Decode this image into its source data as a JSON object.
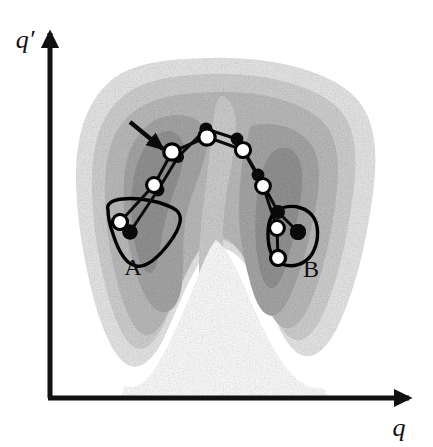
{
  "figure": {
    "kind": "free-energy-landscape-diagram",
    "width": 433,
    "height": 447,
    "background_color": "#ffffff"
  },
  "axes": {
    "x_label": "q",
    "y_label": "q′",
    "color": "#111111",
    "origin_x": 50,
    "origin_y": 398,
    "x_end": 412,
    "y_end": 30,
    "line_width": 5,
    "arrow_head": "solid-triangle"
  },
  "contours": {
    "description": "nested grayscale free-energy bands with a saddle ridge separating two basins",
    "levels": [
      {
        "name": "band-outer",
        "color": "#e9e9e9"
      },
      {
        "name": "band-2",
        "color": "#d2d2d2"
      },
      {
        "name": "band-3",
        "color": "#bdbdbd"
      },
      {
        "name": "band-4",
        "color": "#a8a8a8"
      },
      {
        "name": "band-core-a",
        "color": "#949494"
      },
      {
        "name": "band-core-b",
        "color": "#949494"
      }
    ],
    "ridge_color": "#cfcfcf",
    "notch_color": "#ffffff"
  },
  "basins": [
    {
      "id": "A",
      "label": "A",
      "label_x": 133,
      "label_y": 275,
      "shape": "triangular-outline",
      "outline_color": "#000000"
    },
    {
      "id": "B",
      "label": "B",
      "label_x": 311,
      "label_y": 277,
      "shape": "rounded-square-outline",
      "outline_color": "#000000"
    }
  ],
  "annotations": {
    "arrow": {
      "name": "pointer-arrow",
      "from_x": 130,
      "from_y": 122,
      "to_x": 166,
      "to_y": 152,
      "color": "#0a0a0a"
    }
  },
  "chains": {
    "open_node_color": "#ffffff",
    "open_node_stroke": "#000000",
    "filled_node_color": "#0a0a0a",
    "link_color": "#0a0a0a",
    "chain_white": {
      "name": "string-of-open-nodes",
      "points": [
        [
          120,
          222
        ],
        [
          154,
          185
        ],
        [
          172,
          152
        ],
        [
          207,
          137
        ],
        [
          243,
          150
        ],
        [
          263,
          186
        ],
        [
          277,
          228
        ],
        [
          278,
          258
        ]
      ]
    },
    "chain_black": {
      "name": "string-of-filled-nodes",
      "points": [
        [
          130,
          232
        ],
        [
          158,
          190
        ],
        [
          178,
          157
        ],
        [
          206,
          129
        ],
        [
          237,
          139
        ],
        [
          258,
          175
        ],
        [
          278,
          212
        ],
        [
          298,
          232
        ]
      ]
    }
  },
  "legend_note": ""
}
